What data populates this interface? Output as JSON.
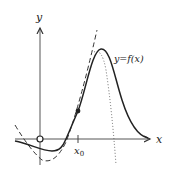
{
  "diagram": {
    "axes": {
      "x_label": "x",
      "y_label": "y",
      "tick_label": "x",
      "tick_subscript": "0"
    },
    "curve_label": "y=f(x)",
    "curves": [
      {
        "name": "function-curve",
        "style": "solid"
      },
      {
        "name": "quadratic-approximation",
        "style": "dashed"
      },
      {
        "name": "higher-order-approximation",
        "style": "dotted"
      }
    ],
    "points": [
      {
        "name": "origin",
        "style": "open-circle"
      },
      {
        "name": "point-at-x0",
        "style": "filled-dot"
      }
    ],
    "colors": {
      "stroke": "#333333",
      "background": "#ffffff"
    }
  }
}
